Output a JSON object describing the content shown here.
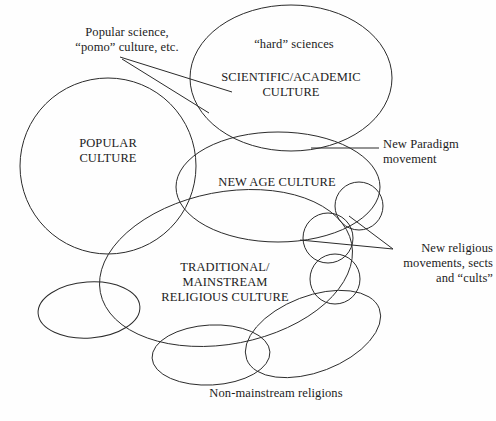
{
  "diagram": {
    "background_color": "#fefefe",
    "stroke_color": "#2b2b2b",
    "text_color": "#1c1c1c",
    "width": 496,
    "height": 421
  },
  "spheres": {
    "popular_culture": "POPULAR\nCULTURE",
    "scientific_academic_culture": "SCIENTIFIC/ACADEMIC\nCULTURE",
    "new_age_culture": "NEW AGE CULTURE",
    "traditional_religious_culture": "TRADITIONAL/\nMAINSTREAM\nRELIGIOUS CULTURE"
  },
  "annotations": {
    "popular_science": "Popular science,\n“pomo” culture, etc.",
    "hard_sciences": "“hard” sciences",
    "new_paradigm": "New Paradigm\nmovement",
    "new_religious_movements": "New religious\nmovements, sects\nand “cults”",
    "non_mainstream_religions": "Non-mainstream religions"
  }
}
